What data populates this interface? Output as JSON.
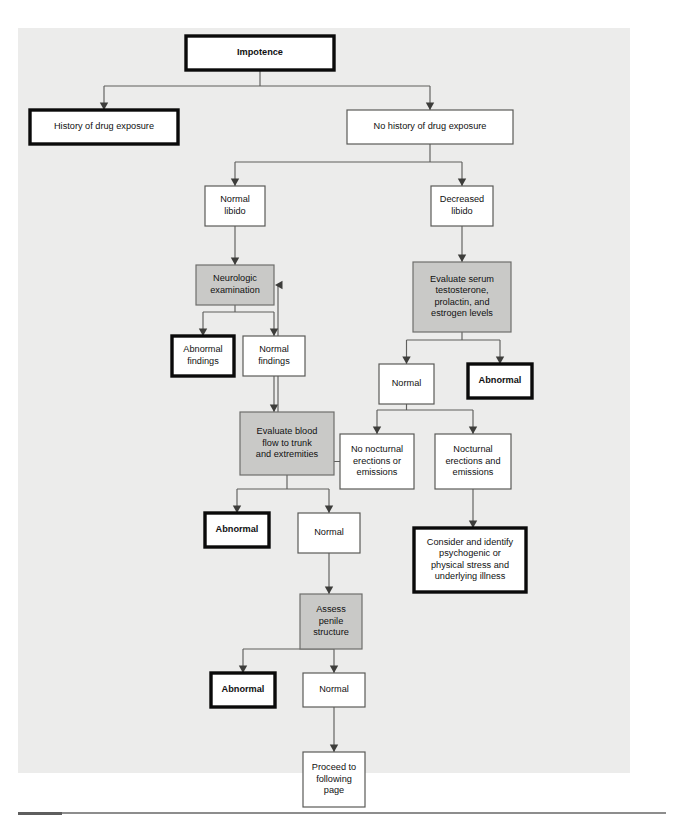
{
  "page": {
    "background_color": "#ffffff",
    "paper_color": "#ececeb",
    "rule_color": "#8d8d8d"
  },
  "legend": {
    "shaded_fill": "#c9c9c7",
    "plain_fill": "#ffffff",
    "bold_outline": "#0a0a0a",
    "thin_outline": "#5a5a58",
    "connector": "#5f5f5d"
  },
  "chart_data": {
    "type": "diagram",
    "diagram_kind": "clinical-decision-flowchart",
    "title": "Impotence",
    "orientation": "top-down",
    "node_styles": {
      "bold": "heavy black outline, white fill — terminal / outcome node",
      "shaded": "gray fill — action or evaluation step",
      "plain": "thin outline, white fill — finding or state"
    },
    "nodes": [
      {
        "id": "impotence",
        "label": "Impotence",
        "style": "bold",
        "bold_text": true,
        "x": 186,
        "y": 36,
        "w": 148,
        "h": 34
      },
      {
        "id": "hx_drug",
        "label": "History of drug exposure",
        "style": "bold",
        "bold_text": false,
        "x": 30,
        "y": 110,
        "w": 148,
        "h": 34
      },
      {
        "id": "no_hx_drug",
        "label": "No history of drug exposure",
        "style": "plain",
        "bold_text": false,
        "x": 347,
        "y": 110,
        "w": 166,
        "h": 34
      },
      {
        "id": "normal_libido",
        "label": "Normal\nlibido",
        "style": "plain",
        "bold_text": false,
        "x": 205,
        "y": 186,
        "w": 60,
        "h": 40
      },
      {
        "id": "decreased_libido",
        "label": "Decreased\nlibido",
        "style": "plain",
        "bold_text": false,
        "x": 431,
        "y": 186,
        "w": 62,
        "h": 40
      },
      {
        "id": "neuro_exam",
        "label": "Neurologic\nexamination",
        "style": "shaded",
        "bold_text": false,
        "x": 196,
        "y": 265,
        "w": 78,
        "h": 40
      },
      {
        "id": "eval_serum",
        "label": "Evaluate serum\ntestosterone,\nprolactin, and\nestrogen levels",
        "style": "shaded",
        "bold_text": false,
        "x": 413,
        "y": 262,
        "w": 98,
        "h": 70
      },
      {
        "id": "abn_findings",
        "label": "Abnormal\nfindings",
        "style": "bold",
        "bold_text": false,
        "x": 172,
        "y": 336,
        "w": 62,
        "h": 40
      },
      {
        "id": "nrm_findings",
        "label": "Normal\nfindings",
        "style": "plain",
        "bold_text": false,
        "x": 243,
        "y": 336,
        "w": 62,
        "h": 40
      },
      {
        "id": "serum_normal",
        "label": "Normal",
        "style": "plain",
        "bold_text": false,
        "x": 379,
        "y": 364,
        "w": 55,
        "h": 40
      },
      {
        "id": "serum_abnormal",
        "label": "Abnormal",
        "style": "bold",
        "bold_text": true,
        "x": 468,
        "y": 364,
        "w": 64,
        "h": 34
      },
      {
        "id": "eval_blood",
        "label": "Evaluate blood\nflow to trunk\nand extremities",
        "style": "shaded",
        "bold_text": false,
        "x": 240,
        "y": 412,
        "w": 94,
        "h": 63
      },
      {
        "id": "no_nocturnal",
        "label": "No nocturnal\nerections or\nemissions",
        "style": "plain",
        "bold_text": false,
        "x": 340,
        "y": 434,
        "w": 74,
        "h": 55
      },
      {
        "id": "yes_nocturnal",
        "label": "Nocturnal\nerections and\nemissions",
        "style": "plain",
        "bold_text": false,
        "x": 435,
        "y": 434,
        "w": 76,
        "h": 55
      },
      {
        "id": "flow_abnormal",
        "label": "Abnormal",
        "style": "bold",
        "bold_text": true,
        "x": 205,
        "y": 513,
        "w": 64,
        "h": 34
      },
      {
        "id": "flow_normal",
        "label": "Normal",
        "style": "plain",
        "bold_text": false,
        "x": 298,
        "y": 513,
        "w": 62,
        "h": 40
      },
      {
        "id": "consider",
        "label": "Consider and identify\npsychogenic or\nphysical stress and\nunderlying illness",
        "style": "bold",
        "bold_text": false,
        "x": 414,
        "y": 528,
        "w": 112,
        "h": 64
      },
      {
        "id": "assess_penile",
        "label": "Assess\npenile\nstructure",
        "style": "shaded",
        "bold_text": false,
        "x": 300,
        "y": 594,
        "w": 62,
        "h": 55
      },
      {
        "id": "pen_abnormal",
        "label": "Abnormal",
        "style": "bold",
        "bold_text": true,
        "x": 211,
        "y": 673,
        "w": 64,
        "h": 34
      },
      {
        "id": "pen_normal",
        "label": "Normal",
        "style": "plain",
        "bold_text": false,
        "x": 303,
        "y": 673,
        "w": 62,
        "h": 34
      },
      {
        "id": "proceed",
        "label": "Proceed to\nfollowing\npage",
        "style": "plain",
        "bold_text": false,
        "x": 303,
        "y": 752,
        "w": 62,
        "h": 55
      }
    ],
    "edges": [
      {
        "from": "impotence",
        "to": "hx_drug",
        "kind": "split"
      },
      {
        "from": "impotence",
        "to": "no_hx_drug",
        "kind": "split"
      },
      {
        "from": "no_hx_drug",
        "to": "normal_libido",
        "kind": "split"
      },
      {
        "from": "no_hx_drug",
        "to": "decreased_libido",
        "kind": "split"
      },
      {
        "from": "normal_libido",
        "to": "neuro_exam",
        "kind": "straight"
      },
      {
        "from": "decreased_libido",
        "to": "eval_serum",
        "kind": "straight"
      },
      {
        "from": "neuro_exam",
        "to": "abn_findings",
        "kind": "split"
      },
      {
        "from": "neuro_exam",
        "to": "nrm_findings",
        "kind": "split"
      },
      {
        "from": "eval_serum",
        "to": "serum_normal",
        "kind": "split"
      },
      {
        "from": "eval_serum",
        "to": "serum_abnormal",
        "kind": "split"
      },
      {
        "from": "nrm_findings",
        "to": "eval_blood",
        "kind": "straight"
      },
      {
        "from": "serum_normal",
        "to": "no_nocturnal",
        "kind": "split"
      },
      {
        "from": "serum_normal",
        "to": "yes_nocturnal",
        "kind": "split"
      },
      {
        "from": "eval_blood",
        "to": "flow_abnormal",
        "kind": "split"
      },
      {
        "from": "eval_blood",
        "to": "flow_normal",
        "kind": "split"
      },
      {
        "from": "yes_nocturnal",
        "to": "consider",
        "kind": "straight"
      },
      {
        "from": "flow_normal",
        "to": "assess_penile",
        "kind": "straight"
      },
      {
        "from": "assess_penile",
        "to": "pen_abnormal",
        "kind": "split"
      },
      {
        "from": "assess_penile",
        "to": "pen_normal",
        "kind": "split"
      },
      {
        "from": "pen_normal",
        "to": "proceed",
        "kind": "straight"
      },
      {
        "from": "no_nocturnal",
        "to": "neuro_exam",
        "kind": "feedback-left-then-up"
      }
    ]
  }
}
